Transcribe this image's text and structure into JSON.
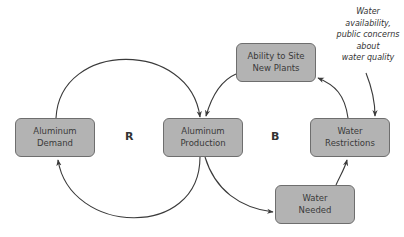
{
  "diagram": {
    "type": "causal-loop",
    "nodes": [
      {
        "id": "aluminum_demand",
        "line1": "Aluminum",
        "line2": "Demand"
      },
      {
        "id": "aluminum_production",
        "line1": "Aluminum",
        "line2": "Production"
      },
      {
        "id": "ability_to_site",
        "line1": "Ability to Site",
        "line2": "New Plants"
      },
      {
        "id": "water_restrictions",
        "line1": "Water",
        "line2": "Restrictions"
      },
      {
        "id": "water_needed",
        "line1": "Water",
        "line2": "Needed"
      }
    ],
    "loops": {
      "reinforcing": "R",
      "balancing": "B"
    },
    "annotation": {
      "lines": [
        "Water",
        "availability,",
        "public concerns",
        "about",
        "water quality"
      ]
    },
    "edges": [
      {
        "from": "aluminum_demand",
        "to": "aluminum_production"
      },
      {
        "from": "aluminum_production",
        "to": "aluminum_demand"
      },
      {
        "from": "aluminum_production",
        "to": "water_needed"
      },
      {
        "from": "water_needed",
        "to": "water_restrictions"
      },
      {
        "from": "water_restrictions",
        "to": "ability_to_site"
      },
      {
        "from": "ability_to_site",
        "to": "aluminum_production"
      },
      {
        "from": "annotation",
        "to": "water_restrictions"
      }
    ],
    "colors": {
      "node_fill": "#b3b3b3",
      "node_border": "#6e6e6e",
      "arrow": "#3a3a3a",
      "text": "#3a3a3a"
    }
  }
}
